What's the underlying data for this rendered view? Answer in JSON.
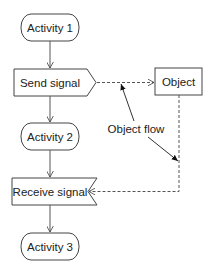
{
  "diagram": {
    "type": "UML activity diagram",
    "nodes": [
      {
        "id": "activity1",
        "label": "Activity 1",
        "shape": "rounded-action"
      },
      {
        "id": "send_signal",
        "label": "Send signal",
        "shape": "send-signal-pentagon"
      },
      {
        "id": "activity2",
        "label": "Activity 2",
        "shape": "rounded-action"
      },
      {
        "id": "receive_signal",
        "label": "Receive signal",
        "shape": "receive-signal-notched"
      },
      {
        "id": "activity3",
        "label": "Activity 3",
        "shape": "rounded-action"
      },
      {
        "id": "object",
        "label": "Object",
        "shape": "rectangle"
      }
    ],
    "annotation": {
      "label": "Object flow"
    },
    "edges": [
      {
        "from": "activity1",
        "to": "send_signal",
        "style": "solid",
        "arrow": "open"
      },
      {
        "from": "send_signal",
        "to": "activity2",
        "style": "solid",
        "arrow": "open"
      },
      {
        "from": "activity2",
        "to": "receive_signal",
        "style": "solid",
        "arrow": "open"
      },
      {
        "from": "receive_signal",
        "to": "activity3",
        "style": "solid",
        "arrow": "open"
      },
      {
        "from": "send_signal",
        "to": "object",
        "style": "dashed",
        "arrow": "open"
      },
      {
        "from": "object",
        "to": "receive_signal",
        "style": "dashed",
        "arrow": "open"
      }
    ],
    "colors": {
      "stroke": "#333333",
      "text": "#222222",
      "background": "#ffffff"
    }
  }
}
